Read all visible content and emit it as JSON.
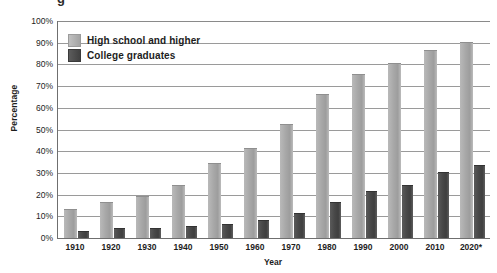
{
  "title_clip": "g",
  "chart_data": {
    "type": "bar",
    "title": "",
    "xlabel": "Year",
    "ylabel": "Percentage",
    "ylim": [
      0,
      100
    ],
    "ytick_labels": [
      "100%",
      "90%",
      "80%",
      "70%",
      "60%",
      "50%",
      "40%",
      "30%",
      "20%",
      "10%",
      "0%"
    ],
    "ytick_values": [
      100,
      90,
      80,
      70,
      60,
      50,
      40,
      30,
      20,
      10,
      0
    ],
    "grid": true,
    "legend_position": "top-left-inside",
    "categories": [
      "1910",
      "1920",
      "1930",
      "1940",
      "1950",
      "1960",
      "1970",
      "1980",
      "1990",
      "2000",
      "2010",
      "2020*"
    ],
    "series": [
      {
        "name": "High school and higher",
        "color": "#a7a7a7",
        "values": [
          13,
          16,
          19,
          24,
          34,
          41,
          52,
          66,
          75,
          80,
          86,
          90
        ]
      },
      {
        "name": "College graduates",
        "color": "#474747",
        "values": [
          3,
          4,
          4,
          5,
          6,
          8,
          11,
          16,
          21,
          24,
          30,
          33
        ]
      }
    ]
  }
}
